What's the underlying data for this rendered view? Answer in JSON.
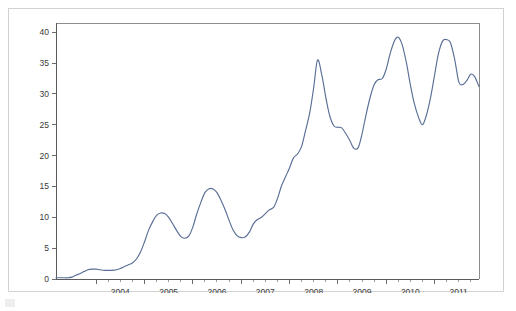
{
  "chart_data": {
    "type": "line",
    "title": "",
    "subtitle": "",
    "xlabel": "",
    "ylabel": "",
    "xlim": [
      2003.17,
      2011.92
    ],
    "ylim": [
      0,
      41.5
    ],
    "yticks": [
      0,
      5,
      10,
      15,
      20,
      25,
      30,
      35,
      40
    ],
    "ytick_labels": [
      "0",
      "5",
      "10",
      "15",
      "20",
      "25",
      "30",
      "35",
      "40"
    ],
    "xticks": [
      2004,
      2005,
      2006,
      2007,
      2008,
      2009,
      2010,
      2011
    ],
    "xtick_labels": [
      "2004",
      "2005",
      "2006",
      "2007",
      "2008",
      "2009",
      "2010",
      "2011"
    ],
    "minor_xticks_per_year": 4,
    "grid": false,
    "legend": null,
    "legend_position": "none",
    "line_color": "#5a6f96",
    "axis_color": "#5b5b5b",
    "frame_color": "#8d8d8d",
    "background_color": "#ffffff",
    "series": [
      {
        "name": "series-1",
        "color": "#5a6f96",
        "x": [
          2003.17,
          2003.25,
          2003.33,
          2003.42,
          2003.5,
          2003.58,
          2003.67,
          2003.75,
          2003.83,
          2003.92,
          2004.0,
          2004.08,
          2004.17,
          2004.25,
          2004.33,
          2004.42,
          2004.5,
          2004.58,
          2004.67,
          2004.75,
          2004.83,
          2004.92,
          2005.0,
          2005.08,
          2005.17,
          2005.25,
          2005.33,
          2005.42,
          2005.5,
          2005.58,
          2005.67,
          2005.75,
          2005.83,
          2005.92,
          2006.0,
          2006.08,
          2006.17,
          2006.25,
          2006.33,
          2006.42,
          2006.5,
          2006.58,
          2006.67,
          2006.75,
          2006.83,
          2006.92,
          2007.0,
          2007.08,
          2007.17,
          2007.25,
          2007.33,
          2007.42,
          2007.5,
          2007.58,
          2007.67,
          2007.75,
          2007.83,
          2007.92,
          2008.0,
          2008.08,
          2008.17,
          2008.25,
          2008.33,
          2008.42,
          2008.5,
          2008.58,
          2008.67,
          2008.75,
          2008.83,
          2008.92,
          2009.0,
          2009.08,
          2009.17,
          2009.25,
          2009.33,
          2009.42,
          2009.5,
          2009.58,
          2009.67,
          2009.75,
          2009.83,
          2009.92,
          2010.0,
          2010.08,
          2010.17,
          2010.25,
          2010.33,
          2010.42,
          2010.5,
          2010.58,
          2010.67,
          2010.75,
          2010.83,
          2010.92,
          2011.0,
          2011.08,
          2011.17,
          2011.25,
          2011.33,
          2011.42,
          2011.5,
          2011.58,
          2011.67,
          2011.75,
          2011.83,
          2011.92
        ],
        "y": [
          0.2,
          0.2,
          0.2,
          0.2,
          0.3,
          0.6,
          0.9,
          1.2,
          1.5,
          1.6,
          1.6,
          1.5,
          1.4,
          1.4,
          1.4,
          1.5,
          1.7,
          2.0,
          2.3,
          2.6,
          3.2,
          4.4,
          6.0,
          7.8,
          9.3,
          10.3,
          10.7,
          10.6,
          10.0,
          9.0,
          7.8,
          6.9,
          6.6,
          7.0,
          8.4,
          10.5,
          12.5,
          14.0,
          14.6,
          14.6,
          14.0,
          12.8,
          11.2,
          9.5,
          8.0,
          7.0,
          6.7,
          6.8,
          7.6,
          8.9,
          9.6,
          10.0,
          10.6,
          11.2,
          11.6,
          13.0,
          15.0,
          16.6,
          18.0,
          19.6,
          20.3,
          21.5,
          24.0,
          27.0,
          31.0,
          35.5,
          33.0,
          29.5,
          26.5,
          24.8,
          24.6,
          24.5,
          23.5,
          22.4,
          21.2,
          21.3,
          23.5,
          26.5,
          29.5,
          31.5,
          32.3,
          32.5,
          34.0,
          36.5,
          38.6,
          39.2,
          38.0,
          35.0,
          31.5,
          28.5,
          26.2,
          25.0,
          26.5,
          29.5,
          33.0,
          36.5,
          38.6,
          38.8,
          38.3,
          35.5,
          32.0,
          31.5,
          32.2,
          33.2,
          32.8,
          31.2
        ]
      },
      {
        "name": "series-1-continued",
        "color": "#5a6f96",
        "x": [],
        "y": []
      }
    ],
    "full_x": [
      2003.17,
      2003.25,
      2003.33,
      2003.42,
      2003.5,
      2003.58,
      2003.67,
      2003.75,
      2003.83,
      2003.92,
      2004.0,
      2004.08,
      2004.17,
      2004.25,
      2004.33,
      2004.42,
      2004.5,
      2004.58,
      2004.67,
      2004.75,
      2004.83,
      2004.92,
      2005.0,
      2005.08,
      2005.17,
      2005.25,
      2005.33,
      2005.42,
      2005.5,
      2005.58,
      2005.67,
      2005.75,
      2005.83,
      2005.92,
      2006.0,
      2006.08,
      2006.17,
      2006.25,
      2006.33,
      2006.42,
      2006.5,
      2006.58,
      2006.67,
      2006.75,
      2006.83,
      2006.92,
      2007.0,
      2007.08,
      2007.17,
      2007.25,
      2007.33,
      2007.42,
      2007.5,
      2007.58,
      2007.67,
      2007.75,
      2007.83,
      2007.92,
      2008.0,
      2008.08,
      2008.17,
      2008.25,
      2008.33,
      2008.42,
      2008.5,
      2008.58,
      2008.67,
      2008.75,
      2008.83,
      2008.92,
      2009.0,
      2009.08,
      2009.17,
      2009.25,
      2009.33,
      2009.42,
      2009.5,
      2009.58,
      2009.67,
      2009.75,
      2009.83,
      2009.92,
      2010.0,
      2010.08,
      2010.17,
      2010.25,
      2010.33,
      2010.42,
      2010.5,
      2010.58,
      2010.67,
      2010.75,
      2010.83,
      2010.92,
      2011.0,
      2011.08,
      2011.17,
      2011.25,
      2011.33,
      2011.42,
      2011.5,
      2011.58,
      2011.67,
      2011.75,
      2011.83,
      2011.92
    ],
    "full_y": [
      0.2,
      0.2,
      0.2,
      0.2,
      0.3,
      0.6,
      0.9,
      1.2,
      1.5,
      1.6,
      1.6,
      1.5,
      1.4,
      1.4,
      1.4,
      1.5,
      1.7,
      2.0,
      2.3,
      2.6,
      3.2,
      4.4,
      6.0,
      7.8,
      9.3,
      10.3,
      10.7,
      10.6,
      10.0,
      9.0,
      7.8,
      6.9,
      6.6,
      7.0,
      8.4,
      10.5,
      12.5,
      14.0,
      14.6,
      14.6,
      14.0,
      12.8,
      11.2,
      9.5,
      8.0,
      7.0,
      6.7,
      6.8,
      7.6,
      8.9,
      9.6,
      10.0,
      10.6,
      11.2,
      11.6,
      13.0,
      15.0,
      16.6,
      18.0,
      19.6,
      20.3,
      21.5,
      24.0,
      27.0,
      31.0,
      35.5,
      33.0,
      29.5,
      26.5,
      24.8,
      24.6,
      24.5,
      23.5,
      22.4,
      21.2,
      21.3,
      23.5,
      26.5,
      29.5,
      31.5,
      32.3,
      32.5,
      34.0,
      36.5,
      38.6,
      39.2,
      38.0,
      35.0,
      31.5,
      28.5,
      26.2,
      25.0,
      26.5,
      29.5,
      33.0,
      36.5,
      38.6,
      38.8,
      38.3,
      35.5,
      32.0,
      31.5,
      32.2,
      33.2,
      32.8,
      31.2
    ],
    "annotations": [],
    "notes": {
      "peak_2008": 35.5,
      "peak_2009": 39.2,
      "peak_2010": 38.8,
      "peak_2011": 38.8,
      "min_start": 0.2,
      "last_value": 25.0
    }
  }
}
